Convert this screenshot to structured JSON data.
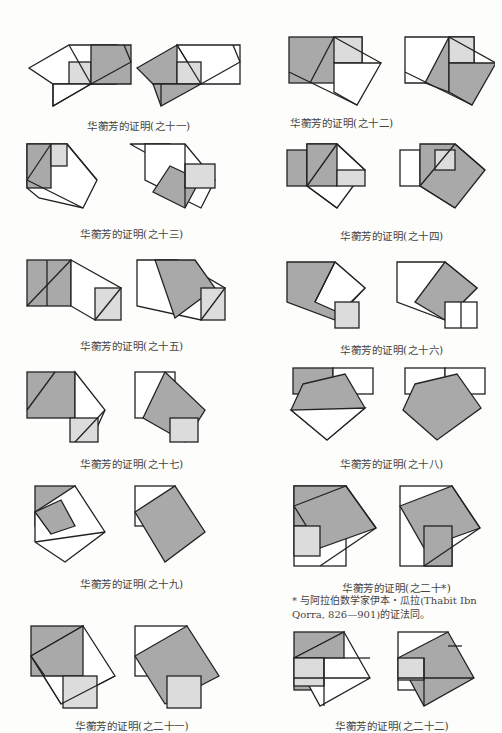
{
  "figures": [
    {
      "caption": "华蘅芳的证明(之十一)"
    },
    {
      "caption": "华蘅芳的证明(之十二)"
    },
    {
      "caption": "华蘅芳的证明(之十三)"
    },
    {
      "caption": "华蘅芳的证明(之十四)"
    },
    {
      "caption": "华蘅芳的证明(之十五)"
    },
    {
      "caption": "华蘅芳的证明(之十六)"
    },
    {
      "caption": "华蘅芳的证明(之十七)"
    },
    {
      "caption": "华蘅芳的证明(之十八)"
    },
    {
      "caption": "华蘅芳的证明(之十九)"
    },
    {
      "caption": "华蘅芳的证明(之二十*)",
      "note": "* 与阿拉伯数学家伊本・瓜拉(Thabit Ibn Qorra, 826—901)的证法同。"
    },
    {
      "caption": "华蘅芳的证明(之二十一)"
    },
    {
      "caption": "华蘅芳的证明(之二十二)"
    }
  ],
  "colors": {
    "dark_fill": "#a9a9a9",
    "light_fill": "#dcdcdc",
    "stroke": "#222222"
  }
}
